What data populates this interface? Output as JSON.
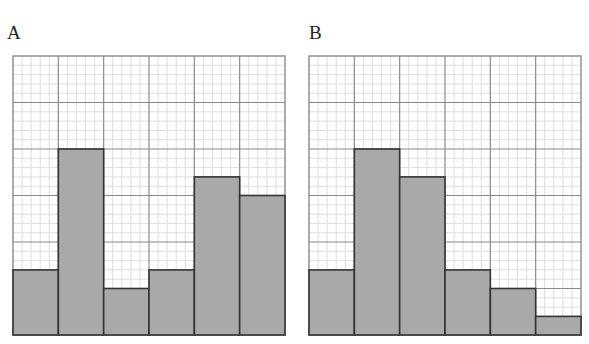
{
  "chart_data": [
    {
      "type": "bar",
      "title": "A",
      "categories": [
        "1",
        "2",
        "3",
        "4",
        "5",
        "6"
      ],
      "values": [
        7,
        20,
        5,
        7,
        17,
        15
      ],
      "units": "minor grid squares (5 minor per major gridline)",
      "values_in_major_units": [
        1.4,
        4,
        1,
        1.4,
        3.4,
        3
      ],
      "xlabel": "",
      "ylabel": "",
      "ylim": [
        0,
        30
      ],
      "grid": true,
      "legend": null
    },
    {
      "type": "bar",
      "title": "B",
      "categories": [
        "1",
        "2",
        "3",
        "4",
        "5",
        "6"
      ],
      "values": [
        7,
        20,
        17,
        7,
        5,
        2
      ],
      "units": "minor grid squares (5 minor per major gridline)",
      "values_in_major_units": [
        1.4,
        4,
        3.4,
        1.4,
        1,
        0.4
      ],
      "xlabel": "",
      "ylabel": "",
      "ylim": [
        0,
        30
      ],
      "grid": true,
      "legend": null
    }
  ],
  "panels": {
    "a": {
      "label": "A"
    },
    "b": {
      "label": "B"
    }
  },
  "style": {
    "bar_fill": "#a9a9a9",
    "bar_stroke": "#333333",
    "major_grid": "#8a8a8a",
    "minor_grid": "#d6d6d6"
  }
}
